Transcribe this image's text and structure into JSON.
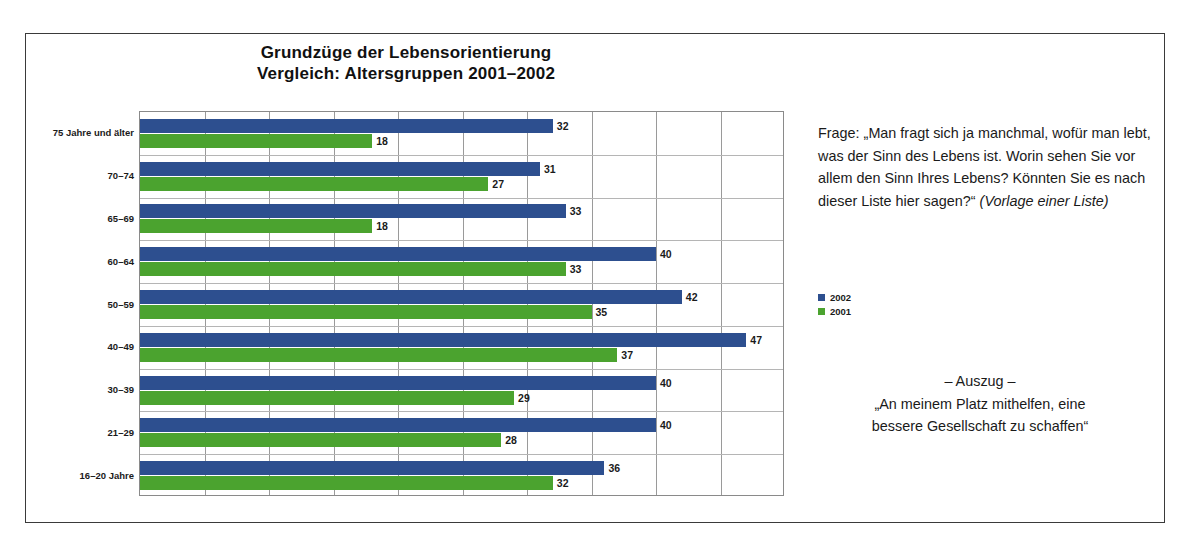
{
  "chart_data": {
    "type": "bar",
    "orientation": "horizontal",
    "title": "Grundzüge der Lebensorientierung",
    "subtitle": "Vergleich: Altersgruppen 2001–2002",
    "xlabel": "",
    "ylabel": "",
    "xlim": [
      0,
      50
    ],
    "grid": true,
    "legend_position": "right",
    "categories": [
      "75 Jahre und älter",
      "70–74",
      "65–69",
      "60–64",
      "50–59",
      "40–49",
      "30–39",
      "21–29",
      "16–20 Jahre"
    ],
    "series": [
      {
        "name": "2002",
        "color": "#2d4f8f",
        "values": [
          32,
          31,
          33,
          40,
          42,
          47,
          40,
          40,
          36
        ]
      },
      {
        "name": "2001",
        "color": "#4ba32f",
        "values": [
          18,
          27,
          18,
          33,
          35,
          37,
          29,
          28,
          32
        ]
      }
    ]
  },
  "title": {
    "line1": "Grundzüge der Lebensorientierung",
    "line2": "Vergleich: Altersgruppen 2001–2002"
  },
  "legend": {
    "items": [
      {
        "label": "2002",
        "color": "#2d4f8f"
      },
      {
        "label": "2001",
        "color": "#4ba32f"
      }
    ]
  },
  "question": {
    "text": "Frage: „Man fragt sich ja manchmal, wofür man lebt, was der Sinn des Lebens ist. Worin sehen Sie vor allem den Sinn Ihres Lebens? Könnten Sie es nach dieser Liste hier sagen?“ ",
    "note": "(Vorlage einer Liste)"
  },
  "excerpt": {
    "heading": "– Auszug –",
    "line1": "„An meinem Platz mithelfen, eine",
    "line2": "bessere Gesellschaft zu schaffen“"
  }
}
